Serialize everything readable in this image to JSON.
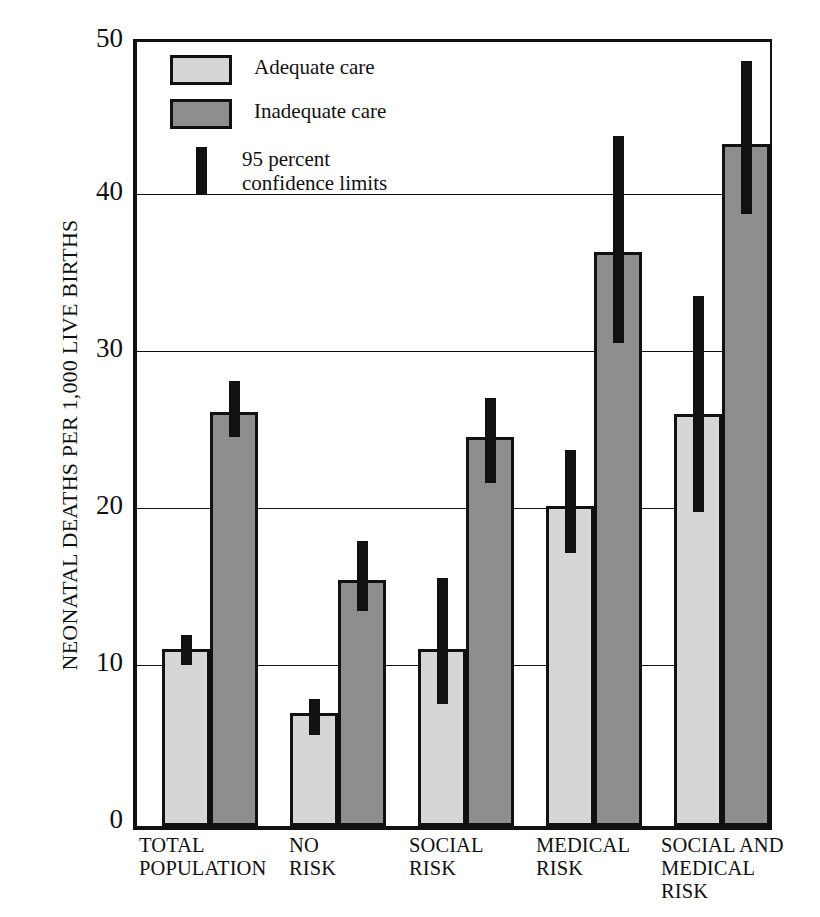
{
  "chart_data": {
    "type": "bar",
    "title": "",
    "xlabel": "",
    "ylabel": "NEONATAL DEATHS PER 1,000 LIVE BIRTHS",
    "ylim": [
      0,
      50
    ],
    "yticks": [
      0,
      10,
      20,
      30,
      40,
      50
    ],
    "grid": "horizontal",
    "legend_position": "inside-top-left",
    "categories": [
      "TOTAL\nPOPULATION",
      "NO\nRISK",
      "SOCIAL\nRISK",
      "MEDICAL\nRISK",
      "SOCIAL AND\nMEDICAL\nRISK"
    ],
    "series": [
      {
        "name": "Adequate care",
        "color": "#d6d6d6",
        "values": [
          11.3,
          7.2,
          11.3,
          20.4,
          26.3
        ],
        "ci_low": [
          10.3,
          5.8,
          7.8,
          17.4,
          20.0
        ],
        "ci_high": [
          12.2,
          8.1,
          15.8,
          24.0,
          33.8
        ]
      },
      {
        "name": "Inadequate care",
        "color": "#8e8e8e",
        "values": [
          26.4,
          15.7,
          24.8,
          36.6,
          43.5
        ],
        "ci_low": [
          24.8,
          13.7,
          21.9,
          30.8,
          39.0
        ],
        "ci_high": [
          28.4,
          18.2,
          27.3,
          44.0,
          48.8
        ]
      }
    ]
  },
  "legend": {
    "items": [
      {
        "label": "Adequate care",
        "marker": "swatch-light"
      },
      {
        "label": "Inadequate care",
        "marker": "swatch-dark"
      },
      {
        "label": "95 percent\nconfidence limits",
        "marker": "ci-bar"
      }
    ]
  },
  "axis": {
    "y_title": "NEONATAL DEATHS PER 1,000 LIVE BIRTHS",
    "y_tick_labels": [
      "50",
      "40",
      "30",
      "20",
      "10",
      "0"
    ]
  }
}
